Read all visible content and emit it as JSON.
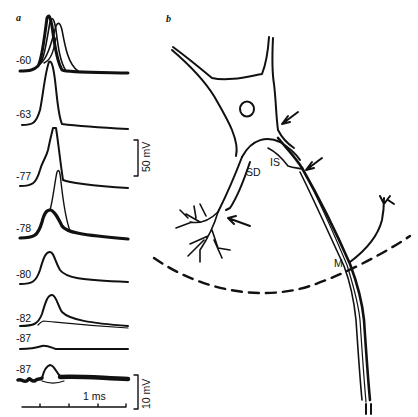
{
  "figure": {
    "panel_a": {
      "label": "a",
      "traces": [
        {
          "holding_potential": "-60"
        },
        {
          "holding_potential": "-63"
        },
        {
          "holding_potential": "-77"
        },
        {
          "holding_potential": "-78"
        },
        {
          "holding_potential": "-80"
        },
        {
          "holding_potential": "-82"
        },
        {
          "holding_potential": "-87"
        },
        {
          "holding_potential": "-87"
        }
      ],
      "scale_bar_upper": "50 mV",
      "scale_bar_lower": "10 mV",
      "time_scale": "1 ms"
    },
    "panel_b": {
      "label": "b",
      "region_labels": {
        "somadendritic": "SD",
        "initial_segment": "IS",
        "myelinated": "M"
      }
    }
  }
}
